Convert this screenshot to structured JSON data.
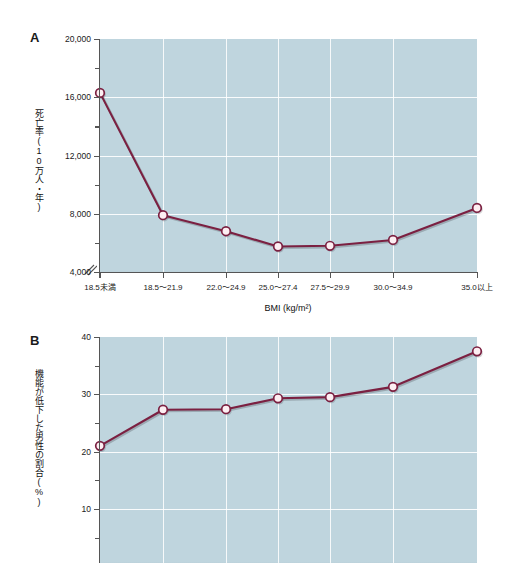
{
  "figure": {
    "panels": [
      {
        "letter": "A",
        "ylabel": "死亡率(10万人・年)",
        "xlabel": "BMI (kg/m²)"
      },
      {
        "letter": "B",
        "ylabel": "機能が低下した男性の割合(%)",
        "xlabel": ""
      }
    ],
    "colors": {
      "plot_background": "#bfd5de",
      "series_line": "#7b2041",
      "marker_fill": "#fdeef2",
      "marker_stroke": "#7b2041",
      "gridline": "#ffffff",
      "axis": "#555555",
      "text": "#1a1a1a"
    }
  },
  "chart_data": [
    {
      "type": "line",
      "panel": "A",
      "title": "",
      "xlabel": "BMI (kg/m²)",
      "ylabel": "死亡率(10万人・年)",
      "categories": [
        "18.5未満",
        "18.5〜21.9",
        "22.0〜24.9",
        "25.0〜27.4",
        "27.5〜29.9",
        "30.0〜34.9",
        "35.0以上"
      ],
      "values": [
        16300,
        7900,
        6800,
        5750,
        5800,
        6200,
        8400
      ],
      "ylim": [
        4000,
        20000
      ],
      "yticks": [
        4000,
        8000,
        12000,
        16000,
        20000
      ],
      "ytick_labels": [
        "4,000",
        "8,000",
        "12,000",
        "16,000",
        "20,000"
      ],
      "yminor_ticks": [
        6000,
        10000,
        14000,
        18000
      ],
      "axis_break": true,
      "grid": "both",
      "legend": "none",
      "marker": "circle-open"
    },
    {
      "type": "line",
      "panel": "B",
      "title": "",
      "xlabel": "",
      "ylabel": "機能が低下した男性の割合(%)",
      "categories": [
        "18.5未満",
        "18.5〜21.9",
        "22.0〜24.9",
        "25.0〜27.4",
        "27.5〜29.9",
        "30.0〜34.9",
        "35.0以上"
      ],
      "values": [
        21.0,
        27.3,
        27.4,
        29.3,
        29.5,
        31.3,
        37.5
      ],
      "ylim": [
        0,
        40
      ],
      "yticks": [
        10,
        20,
        30,
        40
      ],
      "ytick_labels": [
        "10",
        "20",
        "30",
        "40"
      ],
      "yminor_ticks": [
        5,
        15,
        25,
        35
      ],
      "axis_break": false,
      "grid": "both",
      "legend": "none",
      "marker": "circle-open"
    }
  ]
}
